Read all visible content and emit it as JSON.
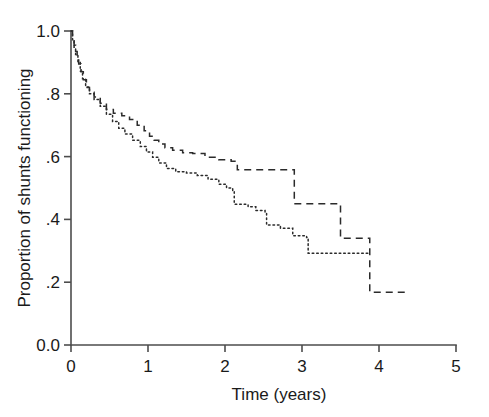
{
  "chart_data": {
    "type": "line",
    "title": "",
    "subtitle": "",
    "xlabel": "Time (years)",
    "ylabel": "Proportion of shunts functioning",
    "xlim": [
      0,
      5
    ],
    "ylim": [
      0,
      1
    ],
    "grid": false,
    "legend": "none",
    "x_ticks": [
      0,
      1,
      2,
      3,
      4,
      5
    ],
    "x_tick_labels": [
      "0",
      "1",
      "2",
      "3",
      "4",
      "5"
    ],
    "y_ticks": [
      0.0,
      0.2,
      0.4,
      0.6,
      0.8,
      1.0
    ],
    "y_tick_labels": [
      "0.0",
      ".2",
      ".4",
      ".6",
      ".8",
      "1.0"
    ],
    "step_style": "post",
    "series": [
      {
        "name": "dashed-curve",
        "style": "dashed",
        "color": "#2b2b2b",
        "x": [
          0.0,
          0.02,
          0.04,
          0.06,
          0.08,
          0.1,
          0.13,
          0.16,
          0.2,
          0.24,
          0.3,
          0.38,
          0.46,
          0.55,
          0.66,
          0.76,
          0.86,
          0.95,
          1.02,
          1.08,
          1.14,
          1.22,
          1.32,
          1.45,
          1.58,
          1.74,
          1.92,
          2.08,
          2.16,
          2.88,
          2.9,
          3.47,
          3.5,
          3.86,
          3.88,
          4.35
        ],
        "y": [
          1.0,
          0.975,
          0.955,
          0.935,
          0.915,
          0.895,
          0.87,
          0.845,
          0.82,
          0.805,
          0.79,
          0.77,
          0.75,
          0.738,
          0.73,
          0.718,
          0.7,
          0.682,
          0.665,
          0.652,
          0.64,
          0.628,
          0.62,
          0.612,
          0.61,
          0.598,
          0.59,
          0.585,
          0.558,
          0.558,
          0.45,
          0.45,
          0.34,
          0.34,
          0.168,
          0.168
        ]
      },
      {
        "name": "dotted-curve",
        "style": "dotted",
        "color": "#2b2b2b",
        "x": [
          0.0,
          0.02,
          0.04,
          0.06,
          0.09,
          0.12,
          0.15,
          0.19,
          0.24,
          0.3,
          0.38,
          0.46,
          0.54,
          0.62,
          0.7,
          0.8,
          0.9,
          0.98,
          1.06,
          1.14,
          1.24,
          1.36,
          1.5,
          1.64,
          1.78,
          1.92,
          2.02,
          2.1,
          2.12,
          2.3,
          2.4,
          2.52,
          2.54,
          2.72,
          2.88,
          3.06,
          3.08,
          3.88
        ],
        "y": [
          1.0,
          0.972,
          0.948,
          0.925,
          0.9,
          0.872,
          0.848,
          0.822,
          0.8,
          0.782,
          0.76,
          0.735,
          0.712,
          0.69,
          0.672,
          0.652,
          0.632,
          0.615,
          0.598,
          0.58,
          0.562,
          0.552,
          0.548,
          0.54,
          0.528,
          0.512,
          0.5,
          0.492,
          0.448,
          0.44,
          0.428,
          0.42,
          0.382,
          0.372,
          0.348,
          0.342,
          0.292,
          0.292
        ]
      }
    ]
  },
  "figure": {
    "caption": ""
  }
}
